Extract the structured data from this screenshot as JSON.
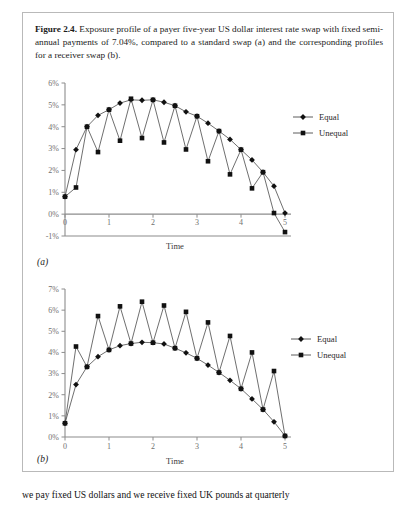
{
  "figure": {
    "caption_label": "Figure 2.4.",
    "caption_text": " Exposure profile of a payer five-year US dollar interest rate swap with fixed semi-annual payments of 7.04%, compared to a standard swap (a) and the corresponding profiles for a receiver swap (b).",
    "panel_a_label": "(a)",
    "panel_b_label": "(b)"
  },
  "body_text": {
    "bottom_paragraph": "we pay fixed US dollars and we receive fixed UK pounds at quarterly"
  },
  "chart_data": [
    {
      "id": "chart-a",
      "type": "line",
      "title": "",
      "xlabel": "Time",
      "ylabel": "",
      "xlim": [
        0,
        5
      ],
      "ylim": [
        -0.01,
        0.06
      ],
      "xticks": [
        0,
        1,
        2,
        3,
        4,
        5
      ],
      "xticklabels": [
        "0",
        "1",
        "2",
        "3",
        "4",
        "5"
      ],
      "yticks": [
        -0.01,
        0,
        0.01,
        0.02,
        0.03,
        0.04,
        0.05,
        0.06
      ],
      "yticklabels": [
        "-1%",
        "0%",
        "1%",
        "2%",
        "3%",
        "4%",
        "5%",
        "6%"
      ],
      "grid": false,
      "legend_position": "right",
      "series": [
        {
          "name": "Equal",
          "marker": "diamond",
          "x": [
            0,
            0.25,
            0.5,
            0.75,
            1.0,
            1.25,
            1.5,
            1.75,
            2.0,
            2.25,
            2.5,
            2.75,
            3.0,
            3.25,
            3.5,
            3.75,
            4.0,
            4.25,
            4.5,
            4.75,
            5.0
          ],
          "y": [
            0.008,
            0.0295,
            0.04,
            0.0452,
            0.0478,
            0.0508,
            0.0523,
            0.0521,
            0.0523,
            0.0512,
            0.0496,
            0.0468,
            0.0448,
            0.0416,
            0.038,
            0.0342,
            0.0295,
            0.0248,
            0.0192,
            0.0128,
            0.0005
          ]
        },
        {
          "name": "Unequal",
          "marker": "square",
          "x": [
            0,
            0.25,
            0.5,
            0.75,
            1.0,
            1.25,
            1.5,
            1.75,
            2.0,
            2.25,
            2.5,
            2.75,
            3.0,
            3.25,
            3.5,
            3.75,
            4.0,
            4.25,
            4.5,
            4.75,
            5.0
          ],
          "y": [
            0.008,
            0.0122,
            0.04,
            0.0284,
            0.0478,
            0.0336,
            0.0528,
            0.0348,
            0.0523,
            0.0328,
            0.0496,
            0.0296,
            0.0448,
            0.0242,
            0.038,
            0.0182,
            0.0295,
            0.0118,
            0.0192,
            0.0005,
            -0.0082
          ]
        }
      ]
    },
    {
      "id": "chart-b",
      "type": "line",
      "title": "",
      "xlabel": "Time",
      "ylabel": "",
      "xlim": [
        0,
        5
      ],
      "ylim": [
        0,
        0.07
      ],
      "xticks": [
        0,
        1,
        2,
        3,
        4,
        5
      ],
      "xticklabels": [
        "0",
        "1",
        "2",
        "3",
        "4",
        "5"
      ],
      "yticks": [
        0,
        0.01,
        0.02,
        0.03,
        0.04,
        0.05,
        0.06,
        0.07
      ],
      "yticklabels": [
        "0%",
        "1%",
        "2%",
        "3%",
        "4%",
        "5%",
        "6%",
        "7%"
      ],
      "grid": false,
      "legend_position": "right",
      "series": [
        {
          "name": "Equal",
          "marker": "diamond",
          "x": [
            0,
            0.25,
            0.5,
            0.75,
            1.0,
            1.25,
            1.5,
            1.75,
            2.0,
            2.25,
            2.5,
            2.75,
            3.0,
            3.25,
            3.5,
            3.75,
            4.0,
            4.25,
            4.5,
            4.75,
            5.0
          ],
          "y": [
            0.0065,
            0.0248,
            0.0332,
            0.038,
            0.0412,
            0.0432,
            0.0442,
            0.0448,
            0.0446,
            0.044,
            0.042,
            0.0398,
            0.0372,
            0.034,
            0.0305,
            0.0268,
            0.0228,
            0.018,
            0.013,
            0.0072,
            0.0005
          ]
        },
        {
          "name": "Unequal",
          "marker": "square",
          "x": [
            0,
            0.25,
            0.5,
            0.75,
            1.0,
            1.25,
            1.5,
            1.75,
            2.0,
            2.25,
            2.5,
            2.75,
            3.0,
            3.25,
            3.5,
            3.75,
            4.0,
            4.25,
            4.5,
            4.75,
            5.0
          ],
          "y": [
            0.0065,
            0.0428,
            0.0332,
            0.0572,
            0.0412,
            0.0618,
            0.0442,
            0.064,
            0.0446,
            0.0622,
            0.042,
            0.0592,
            0.0372,
            0.0542,
            0.0305,
            0.0478,
            0.0228,
            0.04,
            0.013,
            0.0312,
            0.0005
          ]
        }
      ]
    }
  ]
}
